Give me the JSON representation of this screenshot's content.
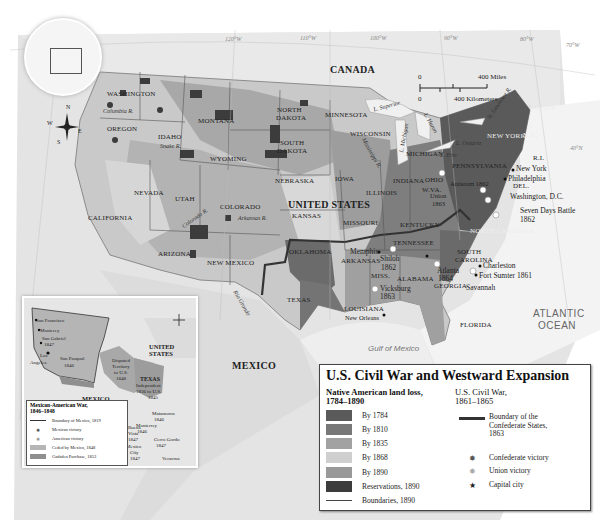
{
  "map": {
    "title": "U.S. Civil War and Westward Expansion",
    "countries": {
      "canada": "CANADA",
      "united_states": "UNITED STATES",
      "mexico": "MEXICO"
    },
    "water": {
      "atlantic_1": "ATLANTIC",
      "atlantic_2": "OCEAN",
      "gulf": "Gulf of Mexico"
    },
    "graticule": [
      "120°W",
      "110°W",
      "100°W",
      "90°W",
      "80°W",
      "70°W",
      "50°N",
      "40°N",
      "30°N",
      "20°N"
    ],
    "states": {
      "washington": "WASHINGTON",
      "oregon": "OREGON",
      "idaho": "IDAHO",
      "montana": "MONTANA",
      "wyoming": "WYOMING",
      "north_dakota_1": "NORTH",
      "north_dakota_2": "DAKOTA",
      "south_dakota_1": "SOUTH",
      "south_dakota_2": "DAKOTA",
      "nebraska": "NEBRASKA",
      "minnesota": "MINNESOTA",
      "wisconsin": "WISCONSIN",
      "iowa": "IOWA",
      "illinois": "ILLINOIS",
      "indiana": "INDIANA",
      "michigan": "MICHIGAN",
      "ohio": "OHIO",
      "wva": "W.VA.",
      "pennsylvania": "PENNSYLVANIA",
      "new_york": "NEW YORK",
      "maine": "MAINE",
      "nh": "N.H.",
      "ri": "R.I.",
      "del": "DEL.",
      "nevada": "NEVADA",
      "california": "CALIFORNIA",
      "utah": "UTAH",
      "colorado": "COLORADO",
      "kansas": "KANSAS",
      "missouri": "MISSOURI",
      "kentucky": "KENTUCKY",
      "tennessee": "TENNESSEE",
      "arizona": "ARIZONA",
      "new_mexico": "NEW MEXICO",
      "oklahoma": "OKLAHOMA",
      "arkansas": "ARKANSAS",
      "texas": "TEXAS",
      "miss": "MISS.",
      "alabama": "ALABAMA",
      "georgia": "GEORGIA",
      "louisiana": "LOUISIANA",
      "florida": "FLORIDA",
      "north_carolina": "NORTH CAROLINA",
      "south_carolina_1": "SOUTH",
      "south_carolina_2": "CAROLINA"
    },
    "rivers": {
      "columbia": "Columbia R.",
      "snake": "Snake R.",
      "colorado": "Colorado R.",
      "arkansas": "Arkansas R.",
      "mississippi": "Mississippi R.",
      "st_lawrence": "St. Lawrence R.",
      "rio_grande": "Rio Grande",
      "l_superior": "L. Superior",
      "l_michigan": "L. Michigan",
      "l_huron": "L. Huron",
      "l_erie": "L. Erie",
      "l_ontario": "L. Ontario"
    },
    "cities": {
      "new_york": "New York",
      "philadelphia": "Philadelphia",
      "washington": "Washington, D.C.",
      "charleston": "Charleston",
      "fort_sumter": "Fort Sumter 1861",
      "savannah": "Savannah",
      "atlanta_1": "Atlanta",
      "atlanta_2": "1864",
      "memphis": "Memphis",
      "shiloh_1": "Shiloh",
      "shiloh_2": "1862",
      "vicksburg_1": "Vicksburg",
      "vicksburg_2": "1863",
      "new_orleans": "New Orleans",
      "antietam": "Antietam 1862",
      "union_1": "Union",
      "union_2": "1863",
      "seven_days_1": "Seven Days Battle",
      "seven_days_2": "1862"
    },
    "scale": {
      "miles_0": "0",
      "miles": "400 Miles",
      "km_0": "0",
      "km": "400 Kilometers"
    },
    "compass": {
      "n": "N",
      "s": "S",
      "e": "E",
      "w": "W"
    }
  },
  "legend": {
    "title": "U.S. Civil War and Westward Expansion",
    "land_loss": {
      "heading_1": "Native American land loss,",
      "heading_2": "1784–1890",
      "items": [
        {
          "label": "By 1784",
          "color": "#5a5a5a"
        },
        {
          "label": "By 1810",
          "color": "#787878"
        },
        {
          "label": "By 1835",
          "color": "#a2a2a2"
        },
        {
          "label": "By 1868",
          "color": "#cfcfcf"
        },
        {
          "label": "By 1890",
          "color": "#999999"
        },
        {
          "label": "Reservations, 1890",
          "color": "#3c3c3c"
        },
        {
          "label": "Boundaries, 1890",
          "color": "#444444"
        }
      ]
    },
    "civil_war": {
      "heading_1": "U.S. Civil War,",
      "heading_2": "1861–1865",
      "items": [
        {
          "label_1": "Boundary of the",
          "label_2": "Confederate States,",
          "label_3": "1863",
          "icon": "boundary-line"
        },
        {
          "label_1": "Confederate victory",
          "icon": "confederate-victory"
        },
        {
          "label_1": "Union victory",
          "icon": "union-victory"
        },
        {
          "label_1": "Capital city",
          "icon": "star",
          "glyph": "★"
        }
      ]
    }
  },
  "inset": {
    "title_1": "Mexican-American War,",
    "title_2": "1846–1848",
    "labels": {
      "san_francisco": "San Francisco",
      "monterey": "Monterey",
      "san_gabriel_1": "San Gabriel",
      "san_gabriel_2": "1847",
      "los_angeles_1": "Los",
      "los_angeles_2": "Angeles",
      "san_pasqual_1": "San Pasqual",
      "san_pasqual_2": "1846",
      "disputed_1": "Disputed",
      "disputed_2": "Territory",
      "disputed_3": "to U.S.",
      "disputed_4": "1848",
      "united_states_1": "UNITED",
      "united_states_2": "STATES",
      "texas_1": "TEXAS",
      "texas_2": "Independent",
      "texas_3": "1836 to U.S.",
      "texas_4": "1845",
      "mexico": "MEXICO",
      "matamoros_1": "Matamoros",
      "matamoros_2": "1846",
      "monterrey_1": "Monterrey",
      "monterrey_2": "1846",
      "buena_vista_1": "Buena",
      "buena_vista_2": "Vista",
      "buena_vista_3": "1847",
      "mexico_city_1": "Mexico",
      "mexico_city_2": "City",
      "mexico_city_3": "1847",
      "cerro_gordo_1": "Cerro Gordo",
      "cerro_gordo_2": "1847",
      "veracruz": "Veracruz"
    },
    "legend": [
      {
        "label": "Boundary of Mexico, 1819",
        "icon": "line",
        "color": "#333333"
      },
      {
        "label": "Mexican victory",
        "icon": "mexican-victory"
      },
      {
        "label": "American victory",
        "icon": "american-victory"
      },
      {
        "label": "Ceded by Mexico, 1848",
        "icon": "swatch",
        "color": "#b5b5b5"
      },
      {
        "label": "Gadsden Purchase, 1853",
        "icon": "swatch",
        "color": "#8f8f8f"
      }
    ]
  }
}
